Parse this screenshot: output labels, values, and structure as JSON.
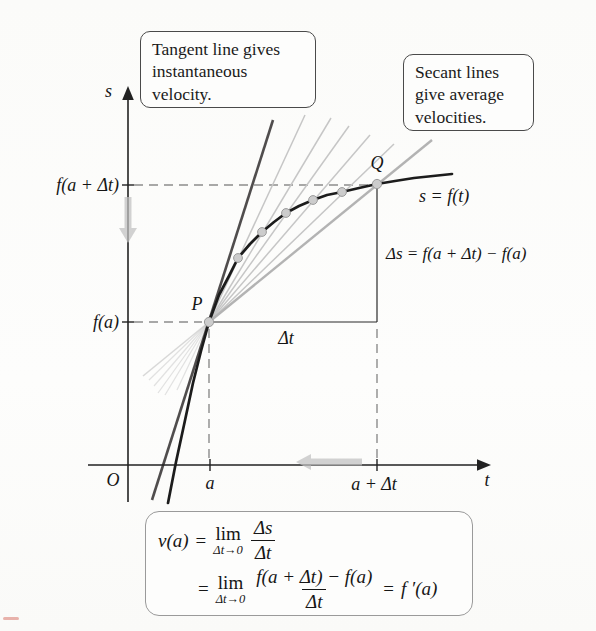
{
  "figure": {
    "callouts": {
      "tangent": "Tangent line gives instantaneous velocity.",
      "secant": "Secant lines give average velocities."
    },
    "labels": {
      "s_axis": "s",
      "t_axis": "t",
      "origin": "O",
      "a": "a",
      "a_plus_delta_t": "a + Δt",
      "f_of_a": "f(a)",
      "f_of_a_plus_delta_t": "f(a + Δt)",
      "point_p": "P",
      "point_q": "Q",
      "curve_equation": "s = f(t)",
      "delta_t": "Δt",
      "delta_s_equation": "Δs = f(a + Δt) − f(a)"
    },
    "formula": {
      "v_of_a": "v(a)",
      "equals_1": "=",
      "lim": "lim",
      "lim_sub": "Δt→0",
      "frac1_num": "Δs",
      "frac1_den": "Δt",
      "equals_2": "=",
      "frac2_num": "f(a + Δt) − f(a)",
      "frac2_den": "Δt",
      "equals_3": "=",
      "f_prime": "f ′(a)"
    },
    "colors": {
      "curve": "#1c1c1c",
      "tangent_line": "#504d4d",
      "secant_line": "#c6c6c6",
      "secant_pq": "#b3b3b3",
      "dashed": "#8c8c8c",
      "dot_fill": "#cccccc",
      "dot_stroke": "#9b9b9b",
      "gray_arrow": "#c0c0c0"
    }
  }
}
